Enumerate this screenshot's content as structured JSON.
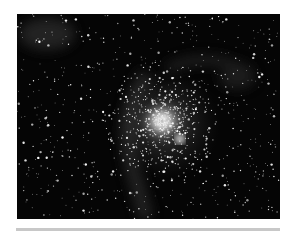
{
  "image": {
    "subject": "globular star cluster with nebula",
    "background_color": "#050505",
    "core_color": "#ffffff",
    "nebula_color": "#3a3a3a"
  },
  "divider": {
    "color": "#c8c8c8"
  }
}
